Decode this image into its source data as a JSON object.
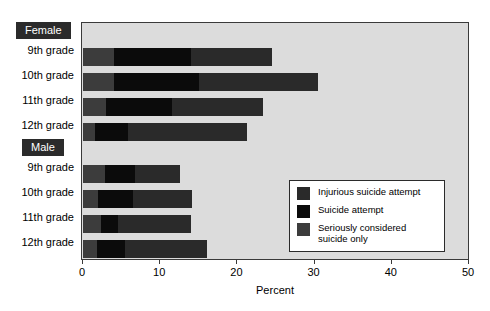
{
  "chart_data": {
    "type": "bar",
    "orientation": "horizontal",
    "stacked": true,
    "title": "",
    "xlabel": "Percent",
    "ylabel": "",
    "xlim": [
      0,
      50
    ],
    "xticks": [
      0,
      10,
      20,
      30,
      40,
      50
    ],
    "grid": false,
    "legend_position": "inside-right-lower",
    "groups": [
      {
        "name": "Female",
        "categories": [
          "9th grade",
          "10th grade",
          "11th grade",
          "12th grade"
        ],
        "series": [
          {
            "name": "Seriously considered suicide only",
            "values": [
              4.0,
              4.0,
              3.0,
              1.5
            ]
          },
          {
            "name": "Suicide attempt",
            "values": [
              10.0,
              11.0,
              8.5,
              4.3
            ]
          },
          {
            "name": "Injurious suicide attempt",
            "values": [
              10.5,
              15.4,
              11.8,
              15.5
            ]
          }
        ],
        "cumulative_totals": [
          24.5,
          30.4,
          23.3,
          21.3
        ]
      },
      {
        "name": "Male",
        "categories": [
          "9th grade",
          "10th grade",
          "11th grade",
          "12th grade"
        ],
        "series": [
          {
            "name": "Seriously considered suicide only",
            "values": [
              2.8,
              2.0,
              2.3,
              1.8
            ]
          },
          {
            "name": "Suicide attempt",
            "values": [
              3.9,
              4.5,
              2.2,
              3.7
            ]
          },
          {
            "name": "Injurious suicide attempt",
            "values": [
              5.9,
              7.6,
              9.5,
              10.5
            ]
          }
        ],
        "cumulative_totals": [
          12.6,
          14.1,
          14.0,
          16.0
        ]
      }
    ],
    "legend": [
      {
        "label": "Injurious suicide attempt",
        "color": "#2a2a2a"
      },
      {
        "label": "Suicide attempt",
        "color": "#0b0b0b"
      },
      {
        "label": "Seriously considered suicide only",
        "color": "#3c3c3c"
      }
    ],
    "colors": {
      "plot_background": "#dcdcdc",
      "axis": "#3a3a3a",
      "group_label_background": "#2b2b2b",
      "group_label_text": "#ffffff"
    }
  },
  "axis": {
    "tick_labels": [
      "0",
      "10",
      "20",
      "30",
      "40",
      "50"
    ],
    "title": "Percent"
  },
  "row_labels": {
    "female_group": "Female",
    "f_9": "9th grade",
    "f_10": "10th grade",
    "f_11": "11th grade",
    "f_12": "12th grade",
    "male_group": "Male",
    "m_9": "9th grade",
    "m_10": "10th grade",
    "m_11": "11th grade",
    "m_12": "12th grade"
  },
  "legend": {
    "item_1": "Injurious suicide attempt",
    "item_2": "Suicide attempt",
    "item_3": "Seriously considered suicide only"
  }
}
